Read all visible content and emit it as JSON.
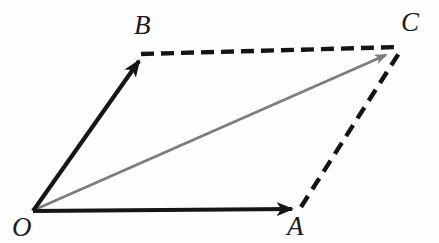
{
  "figure": {
    "kind": "vector-parallelogram-diagram",
    "width": 439,
    "height": 243,
    "background_color": "#fefefe"
  },
  "labels": {
    "origin": "O",
    "a": "A",
    "b": "B",
    "c": "C"
  },
  "colors": {
    "solid_vector": "#161616",
    "resultant_vector": "#7d7d7d",
    "dashed_line": "#141414",
    "label_text": "#1a1a1a",
    "background": "#fefefe"
  },
  "points": {
    "O": {
      "x": 33,
      "y": 211
    },
    "A": {
      "x": 298,
      "y": 209
    },
    "B": {
      "x": 142,
      "y": 56
    },
    "C": {
      "x": 399,
      "y": 48
    }
  },
  "vectors": [
    {
      "name": "OA",
      "from": "O",
      "to": "A",
      "style": "solid",
      "color": "#161616",
      "width": 4.2,
      "arrowhead": true,
      "x1": 33,
      "y1": 211,
      "x2": 292,
      "y2": 209
    },
    {
      "name": "OB",
      "from": "O",
      "to": "B",
      "style": "solid",
      "color": "#161616",
      "width": 4.2,
      "arrowhead": true,
      "x1": 33,
      "y1": 211,
      "x2": 139,
      "y2": 61
    },
    {
      "name": "OC",
      "from": "O",
      "to": "C",
      "style": "solid",
      "color": "#7d7d7d",
      "width": 2.8,
      "arrowhead": true,
      "x1": 34,
      "y1": 210,
      "x2": 386,
      "y2": 55
    }
  ],
  "dashed_edges": [
    {
      "name": "BC",
      "from": "B",
      "to": "C",
      "style": "dashed",
      "color": "#141414",
      "width": 4.4,
      "dash_pattern": "13 7",
      "x1": 141,
      "y1": 54,
      "x2": 400,
      "y2": 47
    },
    {
      "name": "AC",
      "from": "A",
      "to": "C",
      "style": "dashed",
      "color": "#141414",
      "width": 4.4,
      "dash_pattern": "13 8",
      "x1": 301,
      "y1": 207,
      "x2": 401,
      "y2": 50
    }
  ]
}
